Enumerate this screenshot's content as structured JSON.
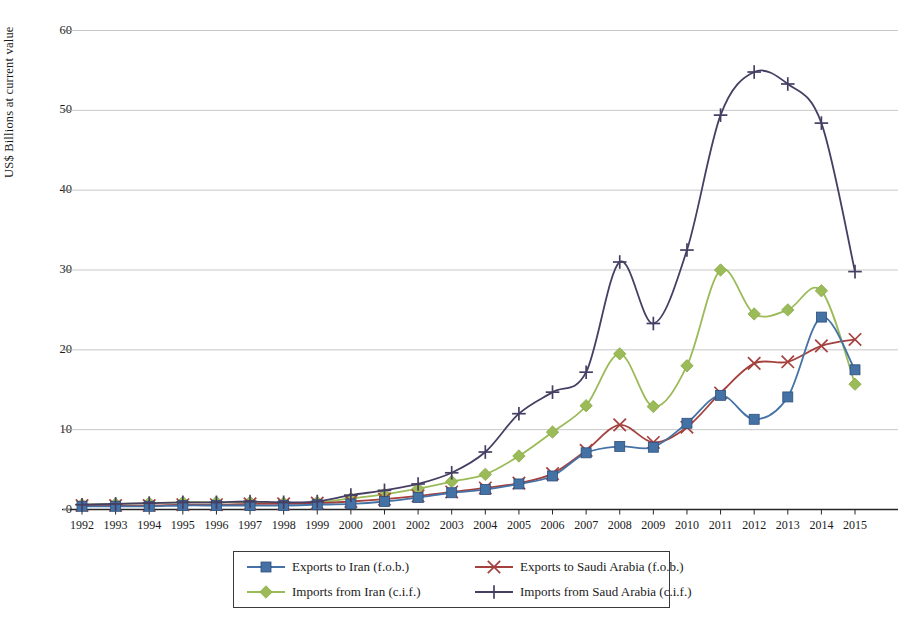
{
  "chart_data": {
    "type": "line",
    "title": "",
    "subtitle": "",
    "xlabel": "",
    "ylabel": "US$ Billions at current value",
    "xlim": [
      1992,
      2015
    ],
    "ylim": [
      0,
      60
    ],
    "ytick_values": [
      0,
      10,
      20,
      30,
      40,
      50,
      60
    ],
    "ytick_labels": [
      "0",
      "10",
      "20",
      "30",
      "40",
      "50",
      "60"
    ],
    "grid": "horizontal",
    "legend_position": "bottom",
    "categories": [
      "1992",
      "1993",
      "1994",
      "1995",
      "1996",
      "1997",
      "1998",
      "1999",
      "2000",
      "2001",
      "2002",
      "2003",
      "2004",
      "2005",
      "2006",
      "2007",
      "2008",
      "2009",
      "2010",
      "2011",
      "2012",
      "2013",
      "2014",
      "2015"
    ],
    "series": [
      {
        "name": "Exports to Iran (f.o.b.)",
        "color": "#4472a4",
        "marker": "square",
        "values": [
          0.4,
          0.4,
          0.4,
          0.5,
          0.5,
          0.5,
          0.5,
          0.6,
          0.7,
          1.0,
          1.5,
          2.1,
          2.5,
          3.2,
          4.2,
          7.1,
          7.9,
          7.8,
          10.8,
          14.3,
          11.3,
          14.1,
          24.1,
          17.5
        ]
      },
      {
        "name": "Exports to Saudi Arabia (f.o.b.)",
        "color": "#a4413e",
        "marker": "cross-x",
        "values": [
          0.5,
          0.5,
          0.5,
          0.6,
          0.6,
          0.7,
          0.7,
          0.8,
          1.0,
          1.3,
          1.7,
          2.2,
          2.7,
          3.3,
          4.5,
          7.4,
          10.6,
          8.4,
          10.3,
          14.6,
          18.3,
          18.5,
          20.5,
          21.3
        ]
      },
      {
        "name": "Imports from Iran (c.i.f.)",
        "color": "#9bbb59",
        "marker": "diamond",
        "values": [
          0.6,
          0.7,
          0.8,
          0.9,
          0.9,
          0.9,
          0.8,
          0.9,
          1.4,
          1.9,
          2.6,
          3.5,
          4.4,
          6.7,
          9.7,
          13.0,
          19.5,
          12.9,
          18.0,
          30.0,
          24.5,
          25.0,
          27.4,
          15.7
        ]
      },
      {
        "name": "Imports from Saud Arabia (c.i.f.)",
        "color": "#463f63",
        "marker": "plus",
        "values": [
          0.6,
          0.7,
          0.8,
          0.9,
          0.9,
          1.0,
          0.9,
          1.0,
          1.8,
          2.4,
          3.2,
          4.6,
          7.2,
          12.0,
          14.7,
          17.2,
          31.0,
          23.3,
          32.5,
          49.4,
          54.8,
          53.3,
          48.4,
          29.8
        ]
      }
    ]
  },
  "legend": {
    "entries": [
      {
        "label": "Exports to Iran (f.o.b.)"
      },
      {
        "label": "Exports to Saudi Arabia (f.o.b.)"
      },
      {
        "label": "Imports from Iran (c.i.f.)"
      },
      {
        "label": "Imports from Saud Arabia (c.i.f.)"
      }
    ]
  },
  "axes": {
    "y_axis_label": "US$ Billions at current value"
  }
}
